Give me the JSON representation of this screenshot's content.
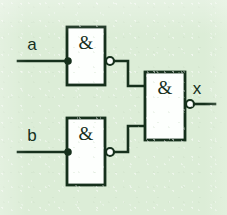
{
  "diagram": {
    "kind": "digital-logic-schematic",
    "background_color": "#dcedd7",
    "line_color": "#16301c",
    "gate_fill_color": "#fdfffd",
    "inputs": [
      {
        "id": "a",
        "label": "a"
      },
      {
        "id": "b",
        "label": "b"
      }
    ],
    "outputs": [
      {
        "id": "x",
        "label": "x"
      }
    ],
    "gates": [
      {
        "id": "gate-top",
        "symbol": "&",
        "type": "NAND",
        "inverted_output": true,
        "inputs": 2,
        "box": {
          "x": 67,
          "y": 27,
          "w": 38,
          "h": 58
        },
        "bubble": {
          "cx": 110,
          "cy": 61,
          "r": 4
        }
      },
      {
        "id": "gate-bottom",
        "symbol": "&",
        "type": "NAND",
        "inverted_output": true,
        "inputs": 2,
        "box": {
          "x": 67,
          "y": 118,
          "w": 38,
          "h": 67
        },
        "bubble": {
          "cx": 110,
          "cy": 152,
          "r": 4
        }
      },
      {
        "id": "gate-output",
        "symbol": "&",
        "type": "NAND",
        "inverted_output": true,
        "inputs": 2,
        "box": {
          "x": 145,
          "y": 72,
          "w": 40,
          "h": 68
        },
        "bubble": {
          "cx": 190,
          "cy": 104,
          "r": 4
        }
      }
    ],
    "junctions": [
      {
        "id": "junction-a",
        "cx": 68,
        "cy": 61,
        "r": 3.6
      },
      {
        "id": "junction-b",
        "cx": 68,
        "cy": 152,
        "r": 3.6
      }
    ],
    "nets": [
      {
        "id": "net-a-stub",
        "points": "18,61 68,61"
      },
      {
        "id": "net-a-bus",
        "points": "68,40 68,79"
      },
      {
        "id": "net-a-to-top-in1",
        "points": "68,40 67,40"
      },
      {
        "id": "net-a-to-top-in2",
        "points": "68,79 67,79"
      },
      {
        "id": "net-b-stub",
        "points": "18,152 68,152"
      },
      {
        "id": "net-b-bus",
        "points": "68,131 68,170"
      },
      {
        "id": "net-b-to-bot-in1",
        "points": "68,131 67,131"
      },
      {
        "id": "net-b-to-bot-in2",
        "points": "68,170 67,170"
      },
      {
        "id": "net-top-to-out",
        "points": "114,61 128,61 128,86 145,86"
      },
      {
        "id": "net-bot-to-out",
        "points": "114,152 128,152 128,126 145,126"
      },
      {
        "id": "net-x-stub",
        "points": "194,104 215,104"
      }
    ],
    "labels": [
      {
        "id": "label-a",
        "text": "a",
        "x": 32,
        "y": 50
      },
      {
        "id": "label-b",
        "text": "b",
        "x": 32,
        "y": 141
      },
      {
        "id": "label-x",
        "text": "x",
        "x": 197,
        "y": 94
      },
      {
        "id": "label-gate-top",
        "text": "&",
        "x": 86,
        "y": 49
      },
      {
        "id": "label-gate-bottom",
        "text": "&",
        "x": 86,
        "y": 140
      },
      {
        "id": "label-gate-output",
        "text": "&",
        "x": 165,
        "y": 94
      }
    ]
  }
}
